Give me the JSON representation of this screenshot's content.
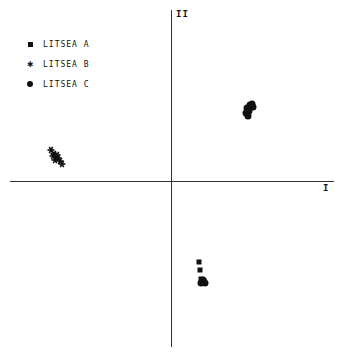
{
  "chart_data": {
    "type": "scatter",
    "title": "",
    "xlabel": "I",
    "ylabel": "II",
    "grid": false,
    "legend_position": "upper-left",
    "axes_style": "centered-cross, no ticks",
    "legend": [
      {
        "name": "LITSEA A",
        "marker": "square"
      },
      {
        "name": "LITSEA B",
        "marker": "star"
      },
      {
        "name": "LITSEA C",
        "marker": "circle"
      }
    ],
    "series": [
      {
        "name": "LITSEA A",
        "marker": "square",
        "points_px": [
          [
            199,
            262
          ],
          [
            200,
            270
          ],
          [
            201,
            279
          ],
          [
            204,
            281
          ]
        ]
      },
      {
        "name": "LITSEA B",
        "marker": "star",
        "points_px": [
          [
            51,
            150
          ],
          [
            54,
            154
          ],
          [
            56,
            157
          ],
          [
            55,
            160
          ],
          [
            58,
            158
          ],
          [
            60,
            161
          ],
          [
            62,
            164
          ],
          [
            53,
            156
          ],
          [
            57,
            155
          ]
        ]
      },
      {
        "name": "LITSEA C",
        "marker": "circle",
        "points_px": [
          [
            247,
            108
          ],
          [
            250,
            105
          ],
          [
            253,
            107
          ],
          [
            246,
            113
          ],
          [
            249,
            111
          ],
          [
            252,
            104
          ],
          [
            248,
            116
          ],
          [
            203,
            280
          ],
          [
            205,
            283
          ],
          [
            201,
            283
          ]
        ]
      }
    ],
    "note": "Points given in pixel coordinates; axes cross at approx (171,181). No numeric tick labels shown."
  },
  "axes": {
    "x_label": "I",
    "y_label": "II"
  },
  "legend": {
    "items": [
      {
        "label": "LITSEA A",
        "marker": "square-icon"
      },
      {
        "label": "LITSEA B",
        "marker": "star-icon"
      },
      {
        "label": "LITSEA C",
        "marker": "circle-icon"
      }
    ]
  },
  "colors": {
    "ink": "#111111",
    "axis": "#333333",
    "background": "#ffffff"
  }
}
